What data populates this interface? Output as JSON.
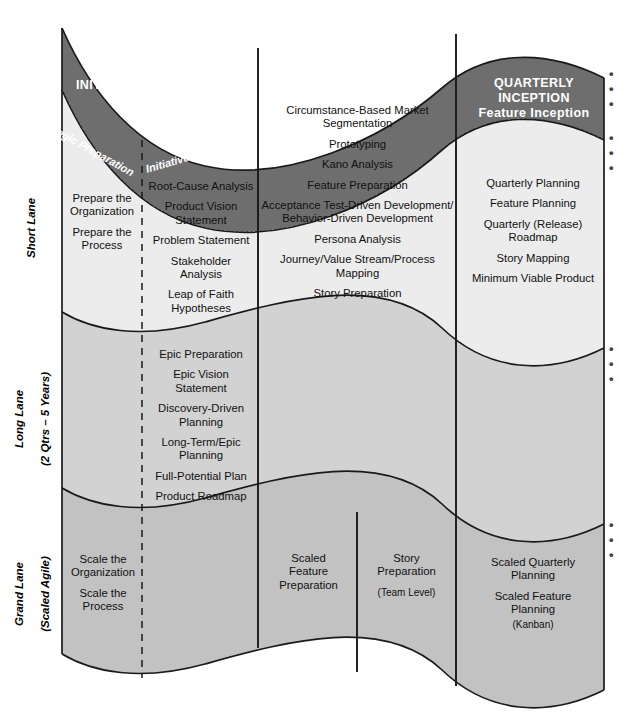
{
  "diagram": {
    "colors": {
      "band_dark": "#6e6e6e",
      "short_lane": "#ececec",
      "long_lane": "#d2d2d2",
      "grand_lane": "#c2c2c2",
      "stroke": "#1a1a1a",
      "text": "#111111",
      "band_text": "#ffffff"
    },
    "ellipsis": "• • •"
  },
  "phases": [
    {
      "id": "initiation",
      "title": "INITIATION AND PLANNING",
      "subtitle": ""
    },
    {
      "id": "seeding",
      "title": "SEEDING THE BACKLOG",
      "subtitle": ""
    },
    {
      "id": "quarterly",
      "title": "QUARTERLY INCEPTION",
      "subtitle": "Feature Inception"
    }
  ],
  "curved_labels": [
    {
      "id": "strategic",
      "text": "Strategic  Preparation"
    },
    {
      "id": "initiative",
      "text": "Initiative Preparation"
    }
  ],
  "lanes": [
    {
      "id": "short",
      "label": "Short Lane",
      "sublabel": ""
    },
    {
      "id": "long",
      "label": "Long Lane",
      "sublabel": "(2 Qtrs – 5 Years)"
    },
    {
      "id": "grand",
      "label": "Grand Lane",
      "sublabel": "(Scaled Agile)"
    }
  ],
  "cells": {
    "short_strategic": {
      "items": [
        "Prepare the\nOrganization",
        "Prepare the\nProcess"
      ]
    },
    "short_initiative": {
      "items": [
        "Root-Cause Analysis",
        "Product Vision\nStatement",
        "Problem Statement",
        "Stakeholder\nAnalysis",
        "Leap of Faith\nHypotheses"
      ]
    },
    "short_seeding": {
      "items": [
        "Circumstance-Based Market\nSegmentation",
        "Prototyping",
        "Kano Analysis",
        "Feature Preparation",
        "Acceptance Test-Driven Development/\nBehavior-Driven Development",
        "Persona Analysis",
        "Journey/Value Stream/Process\nMapping",
        "Story Preparation"
      ]
    },
    "short_quarterly": {
      "items": [
        "Quarterly Planning",
        "Feature Planning",
        "Quarterly (Release)\nRoadmap",
        "Story Mapping",
        "Minimum Viable Product"
      ]
    },
    "long_initiative": {
      "items": [
        "Epic Preparation",
        "Epic Vision\nStatement",
        "Discovery-Driven\nPlanning",
        "Long-Term/Epic\nPlanning",
        "Full-Potential Plan",
        "Product Roadmap"
      ]
    },
    "grand_strategic": {
      "items": [
        "Scale the\nOrganization",
        "Scale the\nProcess"
      ]
    },
    "grand_seeding_left": {
      "items": [
        "Scaled\nFeature\nPreparation"
      ]
    },
    "grand_seeding_right": {
      "items": [
        "Story\nPreparation"
      ],
      "sub": "(Team Level)"
    },
    "grand_quarterly": {
      "items": [
        "Scaled Quarterly\nPlanning",
        "Scaled Feature\nPlanning"
      ],
      "sub": "(Kanban)"
    }
  }
}
